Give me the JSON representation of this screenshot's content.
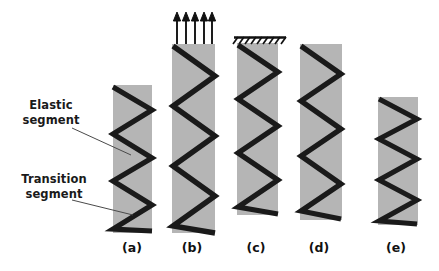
{
  "figure": {
    "background_color": "#ffffff",
    "bar_color": "#b5b5b5",
    "zigzag_color": "#1a1a1a",
    "annotation_color": "#1a1a1a",
    "leader_color": "#4a4a4a"
  },
  "annotations": [
    {
      "name": "elastic-segment",
      "line1": "Elastic",
      "line2": "segment",
      "text": "Elastic segment",
      "leader": {
        "x1": 72,
        "y1": 128,
        "x2": 131,
        "y2": 155
      }
    },
    {
      "name": "transition-segment",
      "line1": "Transition",
      "line2": "segment",
      "text": "Transition segment",
      "leader": {
        "x1": 72,
        "y1": 200,
        "x2": 133,
        "y2": 215
      }
    }
  ],
  "columns": [
    {
      "id": "a",
      "caption": "(a)",
      "caption_x": 132,
      "caption_y": 240,
      "bar": {
        "x": 113,
        "y": 85,
        "width": 39,
        "height": 148
      },
      "zigzag": {
        "points": "113,87 152,110 113,134 152,158 113,181 152,205 113,229 152,231",
        "stroke_width": 5.2
      },
      "top_boundary": "free",
      "arrows": 0
    },
    {
      "id": "b",
      "caption": "(b)",
      "caption_x": 192,
      "caption_y": 240,
      "bar": {
        "x": 172,
        "y": 44,
        "width": 43,
        "height": 189
      },
      "zigzag": {
        "points": "173,46 215,76 173,106 215,136 173,166 215,196 173,226 215,233",
        "stroke_width": 5.4
      },
      "top_boundary": "tension-arrows",
      "arrows": 5,
      "arrow_tip_y": 13,
      "arrow_base_y": 44,
      "arrow_xs": [
        177,
        186,
        195,
        204,
        212
      ]
    },
    {
      "id": "c",
      "caption": "(c)",
      "caption_x": 256,
      "caption_y": 240,
      "bar": {
        "x": 237,
        "y": 43,
        "width": 41,
        "height": 172
      },
      "zigzag": {
        "points": "238,45 278,72 238,99 278,126 238,153 278,180 238,207 278,214",
        "stroke_width": 5.2
      },
      "top_boundary": "fixed-support",
      "support": {
        "x1": 234,
        "x2": 286,
        "y": 37,
        "hatch_count": 9
      },
      "arrows": 0
    },
    {
      "id": "d",
      "caption": "(d)",
      "caption_x": 319,
      "caption_y": 240,
      "bar": {
        "x": 300,
        "y": 44,
        "width": 42,
        "height": 176
      },
      "zigzag": {
        "points": "301,46 341,74 301,101 341,129 301,156 341,184 301,211 341,219",
        "stroke_width": 5.2
      },
      "top_boundary": "free",
      "arrows": 0
    },
    {
      "id": "e",
      "caption": "(e)",
      "caption_x": 396,
      "caption_y": 240,
      "bar": {
        "x": 378,
        "y": 97,
        "width": 40,
        "height": 128
      },
      "zigzag": {
        "points": "379,99 417,119 379,139 417,159 379,180 417,200 379,221 417,224",
        "stroke_width": 5.0
      },
      "top_boundary": "free",
      "arrows": 0
    }
  ]
}
